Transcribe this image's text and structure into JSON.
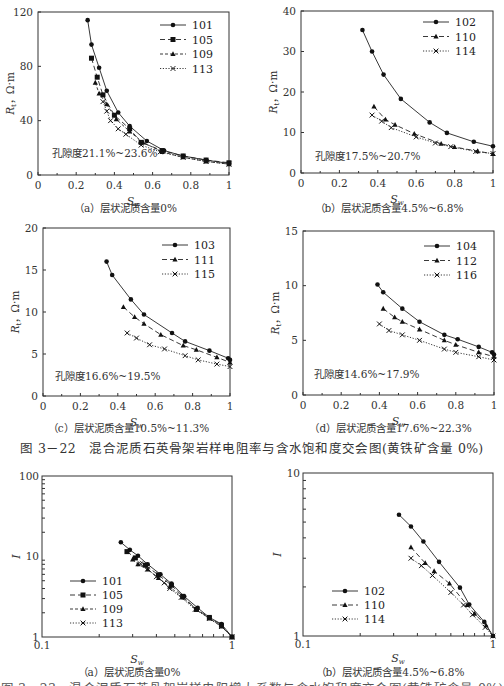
{
  "figure_caption_main": "图 3－22　混合泥质石英骨架岩样电阻率与含水饱和度交会图(黄铁矿含量 0%)",
  "figure_caption_bottom_partial": "图 3－23　混合泥质石英骨架岩样电阻增大系数与含水饱和度交会图(黄铁矿含量 0%)",
  "chart_data": [
    {
      "id": "a",
      "type": "line",
      "scale": "linear",
      "title": "（a）层状泥质含量0%",
      "annotation": "孔隙度21.1%~23.6%",
      "xlabel": "Sw",
      "ylabel": "Rt，Ω·m",
      "xlim": [
        0,
        1
      ],
      "ylim": [
        0,
        120
      ],
      "xticks": [
        "0",
        "0.2",
        "0.4",
        "0.6",
        "0.8",
        "1"
      ],
      "yticks": [
        "0",
        "40",
        "80",
        "120"
      ],
      "legend_position": "upper right",
      "series": [
        {
          "name": "101",
          "style": "solid",
          "marker": "circle",
          "x": [
            0.26,
            0.28,
            0.32,
            0.36,
            0.42,
            0.48,
            0.57,
            0.66,
            0.76,
            0.88,
            1.0
          ],
          "y": [
            114,
            96,
            79,
            62,
            46,
            36,
            25,
            18,
            14,
            11,
            8.5
          ]
        },
        {
          "name": "105",
          "style": "dash",
          "marker": "square",
          "x": [
            0.28,
            0.31,
            0.34,
            0.4,
            0.48,
            0.54,
            0.65,
            0.76,
            0.88,
            1.0
          ],
          "y": [
            86,
            72,
            59,
            44,
            34,
            24,
            18,
            14,
            11,
            9
          ]
        },
        {
          "name": "109",
          "style": "dot-dash",
          "marker": "triangle",
          "x": [
            0.3,
            0.32,
            0.36,
            0.41,
            0.48,
            0.55,
            0.65,
            0.76,
            0.88,
            1.0
          ],
          "y": [
            68,
            60,
            52,
            41,
            32,
            24,
            17,
            13,
            10,
            8
          ]
        },
        {
          "name": "113",
          "style": "dotted",
          "marker": "cross",
          "x": [
            0.34,
            0.36,
            0.38,
            0.42,
            0.46,
            0.54,
            0.64,
            0.76,
            0.88,
            1.0
          ],
          "y": [
            54,
            47,
            40,
            34,
            30,
            22,
            17,
            13,
            10,
            8
          ]
        }
      ]
    },
    {
      "id": "b",
      "type": "line",
      "scale": "linear",
      "title": "（b）层状泥质含量4.5%~6.8%",
      "annotation": "孔隙度17.5%~20.7%",
      "xlabel": "Sw",
      "ylabel": "Rt，Ω·m",
      "xlim": [
        0,
        1
      ],
      "ylim": [
        0,
        40
      ],
      "xticks": [
        "0",
        "0.2",
        "0.4",
        "0.6",
        "0.8",
        "1"
      ],
      "yticks": [
        "0",
        "10",
        "20",
        "30",
        "40"
      ],
      "legend_position": "upper right",
      "series": [
        {
          "name": "102",
          "style": "solid",
          "marker": "circle",
          "x": [
            0.32,
            0.37,
            0.43,
            0.52,
            0.67,
            0.76,
            0.9,
            1.0
          ],
          "y": [
            35.3,
            30.0,
            24.3,
            18.3,
            12.5,
            9.9,
            7.7,
            6.6
          ]
        },
        {
          "name": "110",
          "style": "dash",
          "marker": "triangle",
          "x": [
            0.38,
            0.44,
            0.49,
            0.59,
            0.73,
            0.8,
            0.92,
            1.0
          ],
          "y": [
            16.4,
            13.2,
            11.9,
            9.7,
            7.2,
            6.4,
            5.4,
            4.7
          ]
        },
        {
          "name": "114",
          "style": "dotted",
          "marker": "cross",
          "x": [
            0.37,
            0.42,
            0.47,
            0.6,
            0.7,
            0.78,
            0.91,
            1.0
          ],
          "y": [
            14.3,
            12.8,
            11.2,
            8.9,
            7.4,
            6.5,
            5.3,
            4.8
          ]
        }
      ]
    },
    {
      "id": "c",
      "type": "line",
      "scale": "linear",
      "title": "（c）层状泥质含量10.5%~11.3%",
      "annotation": "孔隙度16.6%~19.5%",
      "xlabel": "Sw",
      "ylabel": "Rt，Ω·m",
      "xlim": [
        0,
        1
      ],
      "ylim": [
        0,
        20
      ],
      "xticks": [
        "0",
        "0.2",
        "0.4",
        "0.6",
        "0.8",
        "1"
      ],
      "yticks": [
        "0",
        "5",
        "10",
        "15",
        "20"
      ],
      "legend_position": "upper right",
      "series": [
        {
          "name": "103",
          "style": "solid",
          "marker": "circle",
          "x": [
            0.34,
            0.37,
            0.47,
            0.54,
            0.69,
            0.76,
            0.89,
            0.99,
            1.0
          ],
          "y": [
            16.0,
            14.4,
            11.5,
            9.7,
            7.5,
            6.5,
            5.4,
            4.5,
            4.3
          ]
        },
        {
          "name": "111",
          "style": "dash",
          "marker": "triangle",
          "x": [
            0.43,
            0.49,
            0.54,
            0.63,
            0.75,
            0.82,
            0.93,
            1.0
          ],
          "y": [
            10.6,
            9.4,
            8.6,
            7.3,
            6.0,
            5.5,
            4.6,
            4.0
          ]
        },
        {
          "name": "115",
          "style": "dotted",
          "marker": "cross",
          "x": [
            0.45,
            0.5,
            0.57,
            0.65,
            0.76,
            0.83,
            0.93,
            1.0
          ],
          "y": [
            7.5,
            6.9,
            6.1,
            5.6,
            4.8,
            4.3,
            3.8,
            3.5
          ]
        }
      ]
    },
    {
      "id": "d",
      "type": "line",
      "scale": "linear",
      "title": "（d）层状泥质含量17.6%~22.3%",
      "annotation": "孔隙度14.6%~17.9%",
      "xlabel": "Sw",
      "ylabel": "Rt，Ω·m",
      "xlim": [
        0,
        1
      ],
      "ylim": [
        0,
        15
      ],
      "xticks": [
        "0",
        "0.2",
        "0.4",
        "0.6",
        "0.8",
        "1"
      ],
      "yticks": [
        "0",
        "5",
        "10",
        "15"
      ],
      "legend_position": "upper right",
      "series": [
        {
          "name": "104",
          "style": "solid",
          "marker": "circle",
          "x": [
            0.39,
            0.42,
            0.52,
            0.61,
            0.74,
            0.81,
            0.92,
            0.99,
            1.0
          ],
          "y": [
            10.1,
            9.4,
            7.9,
            6.7,
            5.5,
            5.1,
            4.4,
            3.9,
            3.7
          ]
        },
        {
          "name": "112",
          "style": "dash",
          "marker": "triangle",
          "x": [
            0.42,
            0.48,
            0.52,
            0.61,
            0.74,
            0.8,
            0.92,
            1.0
          ],
          "y": [
            7.9,
            7.1,
            6.7,
            6.0,
            5.0,
            4.6,
            3.9,
            3.5
          ]
        },
        {
          "name": "116",
          "style": "dotted",
          "marker": "cross",
          "x": [
            0.4,
            0.45,
            0.52,
            0.61,
            0.74,
            0.8,
            0.92,
            1.0
          ],
          "y": [
            6.5,
            5.9,
            5.5,
            5.0,
            4.2,
            3.9,
            3.5,
            3.2
          ]
        }
      ]
    },
    {
      "id": "e",
      "type": "line",
      "scale": "log-log",
      "title": "（a）层状泥质含量0%",
      "xlabel": "Sw",
      "ylabel": "I",
      "xlim": [
        0.1,
        1
      ],
      "ylim": [
        1,
        100
      ],
      "xticks": [
        "0.1",
        "1"
      ],
      "yticks": [
        "1",
        "10",
        "100"
      ],
      "legend_position": "lower left",
      "series": [
        {
          "name": "101",
          "style": "solid",
          "marker": "circle",
          "x": [
            0.26,
            0.29,
            0.32,
            0.36,
            0.42,
            0.48,
            0.56,
            0.66,
            0.76,
            0.88,
            1.0
          ],
          "y": [
            15.0,
            12.1,
            10.2,
            8.0,
            6.0,
            4.6,
            3.2,
            2.3,
            1.75,
            1.45,
            1.0
          ]
        },
        {
          "name": "105",
          "style": "dash",
          "marker": "square",
          "x": [
            0.28,
            0.31,
            0.35,
            0.41,
            0.48,
            0.55,
            0.65,
            0.76,
            0.88,
            1.0
          ],
          "y": [
            11.5,
            9.6,
            7.8,
            5.9,
            4.4,
            3.2,
            2.2,
            1.75,
            1.4,
            1.0
          ]
        },
        {
          "name": "109",
          "style": "dot-dash",
          "marker": "triangle",
          "x": [
            0.3,
            0.32,
            0.36,
            0.41,
            0.47,
            0.55,
            0.65,
            0.76,
            0.88,
            1.0
          ],
          "y": [
            9.2,
            8.0,
            6.9,
            5.4,
            4.2,
            3.1,
            2.2,
            1.7,
            1.35,
            1.0
          ]
        },
        {
          "name": "113",
          "style": "dotted",
          "marker": "cross",
          "x": [
            0.33,
            0.36,
            0.4,
            0.44,
            0.47,
            0.54,
            0.64,
            0.76,
            0.88,
            1.0
          ],
          "y": [
            8.1,
            7.0,
            5.6,
            4.7,
            4.0,
            3.1,
            2.2,
            1.7,
            1.35,
            1.0
          ]
        }
      ]
    },
    {
      "id": "f",
      "type": "line",
      "scale": "log-log",
      "title": "（b）层状泥质含量4.5%~6.8%",
      "xlabel": "Sw",
      "ylabel": "I",
      "xlim": [
        0.1,
        1
      ],
      "ylim": [
        1,
        10
      ],
      "xticks": [
        "0.1",
        "1"
      ],
      "yticks": [
        "1",
        "10"
      ],
      "legend_position": "lower left",
      "series": [
        {
          "name": "102",
          "style": "solid",
          "marker": "circle",
          "x": [
            0.32,
            0.37,
            0.43,
            0.52,
            0.67,
            0.75,
            0.9,
            1.0
          ],
          "y": [
            5.55,
            4.7,
            3.8,
            2.85,
            1.98,
            1.56,
            1.22,
            1.0
          ]
        },
        {
          "name": "110",
          "style": "dash",
          "marker": "triangle",
          "x": [
            0.37,
            0.44,
            0.49,
            0.59,
            0.73,
            0.8,
            0.92,
            1.0
          ],
          "y": [
            3.5,
            2.8,
            2.5,
            2.1,
            1.55,
            1.37,
            1.16,
            1.0
          ]
        },
        {
          "name": "114",
          "style": "dotted",
          "marker": "cross",
          "x": [
            0.37,
            0.42,
            0.48,
            0.6,
            0.7,
            0.78,
            0.91,
            1.0
          ],
          "y": [
            3.0,
            2.7,
            2.35,
            1.85,
            1.55,
            1.35,
            1.13,
            1.0
          ]
        }
      ]
    }
  ]
}
